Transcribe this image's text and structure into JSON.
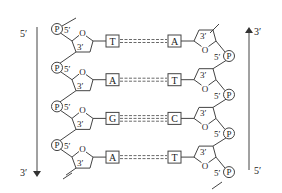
{
  "diagram": {
    "left_strand": {
      "direction_top": "5′",
      "direction_bottom": "3′",
      "arrow": "down"
    },
    "right_strand": {
      "direction_top": "3′",
      "direction_bottom": "5′",
      "arrow": "up"
    },
    "phosphate_label": "P",
    "sugar_oxygen_label": "O",
    "carbon_5_label": "5′",
    "carbon_3_label": "3′",
    "pairs": [
      {
        "left": "T",
        "right": "A",
        "hbonds": 2
      },
      {
        "left": "A",
        "right": "T",
        "hbonds": 2
      },
      {
        "left": "G",
        "right": "C",
        "hbonds": 3
      },
      {
        "left": "A",
        "right": "T",
        "hbonds": 2
      }
    ]
  }
}
